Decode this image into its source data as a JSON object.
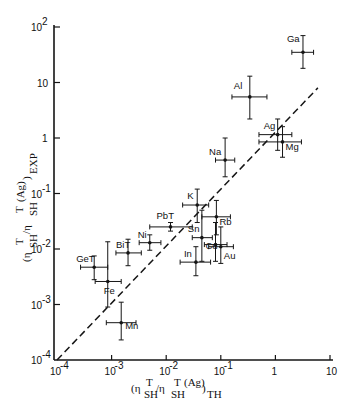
{
  "chart_data": {
    "type": "scatter",
    "title": "",
    "xlabel": "(η^T_SH / η^T_SH (Ag))_TH",
    "ylabel": "(η^T_SH / η^T_SH (Ag))_EXP",
    "xscale": "log",
    "yscale": "log",
    "xlim": [
      0.0001,
      10
    ],
    "ylim": [
      0.0001,
      100
    ],
    "x_ticks": [
      "10^-4",
      "10^-3",
      "10^-2",
      "10^-1",
      "1",
      "10"
    ],
    "y_ticks": [
      "10^-4",
      "10^-3",
      "10^-2",
      "10^-1",
      "1",
      "10",
      "10^2"
    ],
    "grid": false,
    "reference_line": {
      "style": "dashed",
      "description": "y = x",
      "from": [
        0.0001,
        0.0001
      ],
      "to": [
        6,
        8
      ]
    },
    "points": [
      {
        "label": "Ga",
        "x": 3.2,
        "y": 35,
        "xerr": [
          2.0,
          5.0
        ],
        "yerr": [
          18,
          70
        ]
      },
      {
        "label": "Al",
        "x": 0.34,
        "y": 5.5,
        "xerr": [
          0.16,
          0.7
        ],
        "yerr": [
          2.2,
          13
        ]
      },
      {
        "label": "Ag",
        "x": 1.1,
        "y": 1.15,
        "xerr": [
          0.5,
          2.0
        ],
        "yerr": [
          0.6,
          2.2
        ]
      },
      {
        "label": "Mg",
        "x": 1.35,
        "y": 0.85,
        "xerr": [
          0.5,
          3.0
        ],
        "yerr": [
          0.45,
          1.6
        ]
      },
      {
        "label": "Na",
        "x": 0.12,
        "y": 0.4,
        "xerr": [
          0.08,
          0.18
        ],
        "yerr": [
          0.2,
          1.0
        ]
      },
      {
        "label": "K",
        "x": 0.037,
        "y": 0.062,
        "xerr": [
          0.02,
          0.06
        ],
        "yerr": [
          0.03,
          0.12
        ]
      },
      {
        "label": "Rb",
        "x": 0.083,
        "y": 0.038,
        "xerr": [
          0.045,
          0.15
        ],
        "yerr": [
          0.018,
          0.075
        ]
      },
      {
        "label": "Sn",
        "x": 0.045,
        "y": 0.016,
        "xerr": [
          0.03,
          0.07
        ],
        "yerr": [
          0.006,
          0.05
        ]
      },
      {
        "label": "Cu",
        "x": 0.08,
        "y": 0.012,
        "xerr": [
          0.05,
          0.13
        ],
        "yerr": [
          0.006,
          0.03
        ]
      },
      {
        "label": "Au",
        "x": 0.1,
        "y": 0.011,
        "xerr": [
          0.06,
          0.17
        ],
        "yerr": [
          0.0055,
          0.025
        ]
      },
      {
        "label": "In",
        "x": 0.035,
        "y": 0.0058,
        "xerr": [
          0.018,
          0.065
        ],
        "yerr": [
          0.0033,
          0.011
        ]
      },
      {
        "label": "Pb",
        "x": 0.012,
        "y": 0.025,
        "xerr": [
          0.005,
          0.03
        ],
        "yerr": [
          0.021,
          0.03
        ]
      },
      {
        "label": "Ni",
        "x": 0.005,
        "y": 0.013,
        "xerr": [
          0.0032,
          0.008
        ],
        "yerr": [
          0.0095,
          0.018
        ]
      },
      {
        "label": "Bi",
        "x": 0.002,
        "y": 0.0085,
        "xerr": [
          0.0012,
          0.0035
        ],
        "yerr": [
          0.005,
          0.015
        ]
      },
      {
        "label": "Ge",
        "x": 0.00048,
        "y": 0.0047,
        "xerr": [
          0.00027,
          0.00085
        ],
        "yerr": [
          0.0028,
          0.0075
        ]
      },
      {
        "label": "Fe",
        "x": 0.00085,
        "y": 0.0026,
        "xerr": [
          0.0005,
          0.0015
        ],
        "yerr": [
          0.0009,
          0.0135
        ]
      },
      {
        "label": "Mn",
        "x": 0.0015,
        "y": 0.00047,
        "xerr": [
          0.0008,
          0.0028
        ],
        "yerr": [
          0.00023,
          0.0011
        ]
      }
    ],
    "label_offsets": {
      "Ga": [
        -16,
        -10
      ],
      "Al": [
        -16,
        -8
      ],
      "Ag": [
        -14,
        -6
      ],
      "Mg": [
        3,
        8
      ],
      "Na": [
        -16,
        -5
      ],
      "K": [
        -10,
        -6
      ],
      "Rb": [
        3,
        8
      ],
      "Sn": [
        -14,
        -6
      ],
      "Cu": [
        -10,
        4
      ],
      "Au": [
        3,
        12
      ],
      "In": [
        -12,
        -5
      ],
      "Pb": [
        -14,
        -8
      ],
      "Ni": [
        -12,
        -5
      ],
      "Bi": [
        -12,
        -5
      ],
      "Ge": [
        -18,
        -5
      ],
      "Fe": [
        -4,
        13
      ],
      "Mn": [
        4,
        6
      ]
    },
    "label_text": {
      "Ga": "Ga",
      "Al": "Al",
      "Ag": "Ag",
      "Mg": "Mg",
      "Na": "Na",
      "K": "K",
      "Rb": "Rb",
      "Sn": "Sn",
      "Cu": "Cu",
      "Au": "Au",
      "In": "In",
      "Pb": "PbT",
      "Ni": "Ni",
      "Bi": "BiT",
      "Ge": "GeT",
      "Fe": "Fe",
      "Mn": "Mn"
    }
  },
  "axes": {
    "x_label_main": "(η",
    "y_label_main": "(η"
  }
}
